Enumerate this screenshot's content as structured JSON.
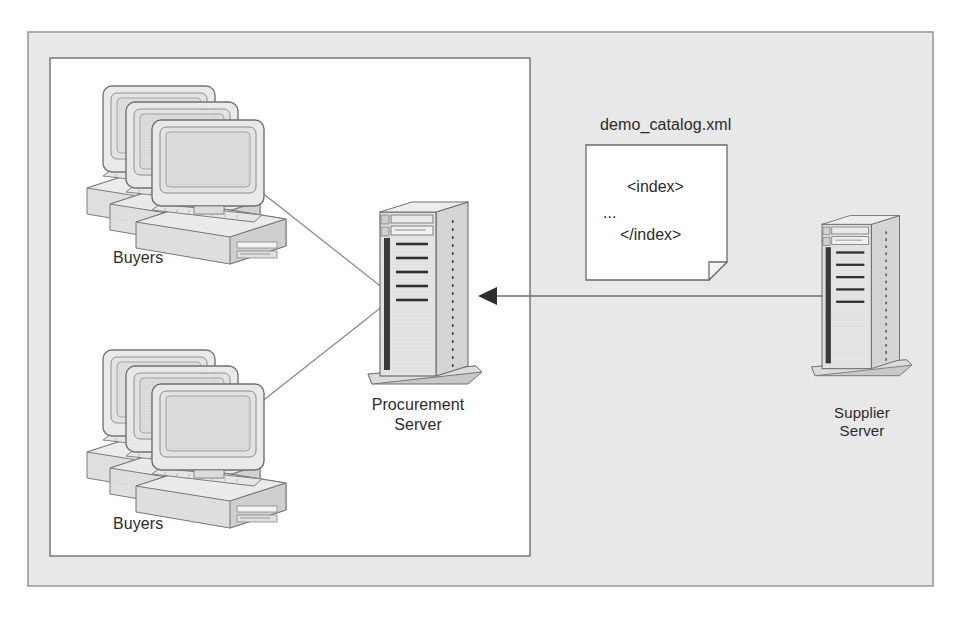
{
  "diagram": {
    "type": "network-architecture",
    "colors": {
      "page_background": "#ffffff",
      "outer_panel_fill": "#e8e8e8",
      "outer_panel_stroke": "#9a9a9a",
      "inner_panel_fill": "#ffffff",
      "inner_panel_stroke": "#6f6f6f",
      "device_fill": "#e2e2e2",
      "device_stroke": "#7a7a7a",
      "device_shadow": "#b9b9b9",
      "connector_stroke": "#8d8d8d",
      "arrow_stroke": "#555555",
      "text": "#2b2b2b",
      "document_fill": "#ffffff",
      "document_stroke": "#6a6a6a"
    }
  },
  "nodes": {
    "buyers_top": {
      "label": "Buyers",
      "icon": "computer-stack-icon",
      "count": 3
    },
    "buyers_bottom": {
      "label": "Buyers",
      "icon": "computer-stack-icon",
      "count": 3
    },
    "procurement_server": {
      "label_line_1": "Procurement",
      "label_line_2": "Server",
      "icon": "tower-server-icon"
    },
    "supplier_server": {
      "label_line_1": "Supplier",
      "label_line_2": "Server",
      "icon": "tower-server-icon"
    }
  },
  "document": {
    "filename": "demo_catalog.xml",
    "icon": "xml-document-icon",
    "lines": [
      "<index>",
      "...",
      "</index>"
    ]
  },
  "connections": [
    {
      "from": "buyers_top",
      "to": "procurement_server",
      "style": "plain-line",
      "arrow": false
    },
    {
      "from": "buyers_bottom",
      "to": "procurement_server",
      "style": "plain-line",
      "arrow": false
    },
    {
      "from": "supplier_server",
      "to": "procurement_server",
      "style": "arrow-line",
      "arrow": true,
      "direction": "left"
    }
  ]
}
